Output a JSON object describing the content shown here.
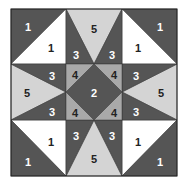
{
  "diagram": {
    "type": "quilt-block",
    "colors": {
      "dark": "#555555",
      "light": "#d4d4d4",
      "medium": "#a9a9a9",
      "white": "#ffffff",
      "border": "#222222",
      "label_on_dark": "#ffffff",
      "label_on_light": "#222222"
    },
    "labels": {
      "tl_dark": "1",
      "tl_white": "1",
      "tr_dark": "1",
      "tr_white": "1",
      "bl_dark": "1",
      "bl_white": "1",
      "br_dark": "1",
      "br_white": "1",
      "top_light": "5",
      "top_left_dark": "3",
      "top_right_dark": "3",
      "bottom_light": "5",
      "bottom_left_dark": "3",
      "bottom_right_dark": "3",
      "left_light": "5",
      "left_top_dark": "3",
      "left_bottom_dark": "3",
      "right_light": "5",
      "right_top_dark": "3",
      "right_bottom_dark": "3",
      "center_diamond": "2",
      "center_tl": "4",
      "center_tr": "4",
      "center_bl": "4",
      "center_br": "4"
    }
  }
}
